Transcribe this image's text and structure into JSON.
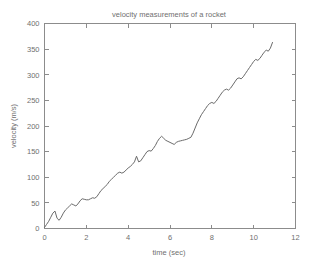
{
  "figure": {
    "background_color": "#ffffff",
    "axis_color": "#8c8c8c",
    "line_color": "#6b6b6b",
    "text_color": "#6f6f6f"
  },
  "chart_data": {
    "type": "line",
    "title": "velocity measurements of a rocket",
    "xlabel": "time (sec)",
    "ylabel": "velocity (m/s)",
    "xlim": [
      0,
      12
    ],
    "ylim": [
      0,
      400
    ],
    "xticks": [
      0,
      2,
      4,
      6,
      8,
      10,
      12
    ],
    "xtick_labels": [
      "0",
      "2",
      "4",
      "6",
      "8",
      "10",
      "12"
    ],
    "yticks": [
      0,
      50,
      100,
      150,
      200,
      250,
      300,
      350,
      400
    ],
    "ytick_labels": [
      "0",
      "50",
      "100",
      "150",
      "200",
      "250",
      "300",
      "350",
      "400"
    ],
    "grid": false,
    "legend": null,
    "series": [
      {
        "name": "velocity",
        "color": "#6b6b6b",
        "x": [
          0.0,
          0.1,
          0.2,
          0.3,
          0.4,
          0.5,
          0.6,
          0.7,
          0.8,
          0.9,
          1.0,
          1.1,
          1.2,
          1.3,
          1.4,
          1.5,
          1.6,
          1.7,
          1.8,
          1.9,
          2.0,
          2.1,
          2.2,
          2.3,
          2.4,
          2.5,
          2.6,
          2.7,
          2.8,
          2.9,
          3.0,
          3.1,
          3.2,
          3.3,
          3.4,
          3.5,
          3.6,
          3.7,
          3.8,
          3.9,
          4.0,
          4.1,
          4.2,
          4.3,
          4.4,
          4.5,
          4.6,
          4.7,
          4.8,
          4.9,
          5.0,
          5.1,
          5.2,
          5.3,
          5.4,
          5.5,
          5.6,
          5.7,
          5.8,
          5.9,
          6.0,
          6.1,
          6.2,
          6.3,
          6.4,
          6.5,
          6.6,
          6.7,
          6.8,
          6.9,
          7.0,
          7.1,
          7.2,
          7.3,
          7.4,
          7.5,
          7.6,
          7.7,
          7.8,
          7.9,
          8.0,
          8.1,
          8.2,
          8.3,
          8.4,
          8.5,
          8.6,
          8.7,
          8.8,
          8.9,
          9.0,
          9.1,
          9.2,
          9.3,
          9.4,
          9.5,
          9.6,
          9.7,
          9.8,
          9.9,
          10.0,
          10.1,
          10.2,
          10.3,
          10.4,
          10.5,
          10.6,
          10.7,
          10.8,
          10.9
        ],
        "y": [
          2,
          8,
          14,
          22,
          30,
          34,
          20,
          16,
          22,
          30,
          36,
          40,
          44,
          48,
          46,
          44,
          48,
          54,
          58,
          57,
          56,
          56,
          58,
          60,
          59,
          62,
          68,
          74,
          78,
          82,
          86,
          92,
          96,
          100,
          104,
          108,
          110,
          108,
          110,
          114,
          118,
          121,
          125,
          130,
          141,
          130,
          132,
          138,
          144,
          150,
          152,
          151,
          156,
          162,
          170,
          176,
          180,
          176,
          172,
          170,
          168,
          166,
          164,
          168,
          170,
          171,
          172,
          173,
          174,
          176,
          178,
          186,
          196,
          206,
          214,
          222,
          228,
          234,
          240,
          244,
          246,
          244,
          248,
          254,
          260,
          266,
          270,
          272,
          270,
          274,
          280,
          286,
          292,
          294,
          292,
          296,
          302,
          308,
          314,
          320,
          326,
          330,
          328,
          332,
          338,
          344,
          348,
          346,
          352,
          363
        ]
      }
    ]
  }
}
